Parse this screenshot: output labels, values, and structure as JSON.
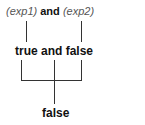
{
  "diagram": {
    "expression": {
      "operand1": "(exp1)",
      "operator": "and",
      "operand2": "(exp2)"
    },
    "evaluated": {
      "text": "true and false"
    },
    "result": {
      "text": "false"
    }
  }
}
